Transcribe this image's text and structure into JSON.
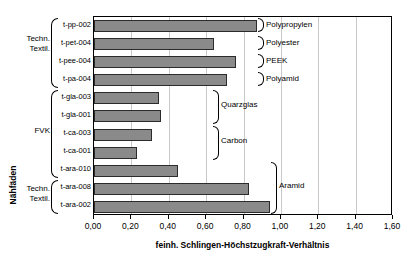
{
  "caption_fragment": "",
  "axes": {
    "y_title": "Nähfäden",
    "x_title": "feinh. Schlingen-Höchstzugkraft-Verhältnis",
    "x_ticks": [
      "0,00",
      "0,20",
      "0,40",
      "0,60",
      "0,80",
      "1,00",
      "1,20",
      "1,40",
      "1,60"
    ]
  },
  "left_groups": [
    {
      "label": "Techn.\nTextil.",
      "line1": "Techn.",
      "line2": "Textil."
    },
    {
      "label": "FVK",
      "line1": "FVK",
      "line2": ""
    },
    {
      "label": "Techn.\nTextil.",
      "line1": "Techn.",
      "line2": "Textil."
    }
  ],
  "left_group_labels": {
    "g0_line1": "Techn.",
    "g0_line2": "Textil.",
    "g1_line1": "FVK",
    "g2_line1": "Techn.",
    "g2_line2": "Textil."
  },
  "materials": [
    {
      "name": "Polypropylen"
    },
    {
      "name": "Polyester"
    },
    {
      "name": "PEEK"
    },
    {
      "name": "Polyamid"
    },
    {
      "name": "Quarzglas"
    },
    {
      "name": "Carbon"
    },
    {
      "name": "Aramid"
    }
  ],
  "material_labels": {
    "m0": "Polypropylen",
    "m1": "Polyester",
    "m2": "PEEK",
    "m3": "Polyamid",
    "m4": "Quarzglas",
    "m5": "Carbon",
    "m6": "Aramid"
  },
  "categories_text": {
    "c0": "t-pp-002",
    "c1": "t-pet-004",
    "c2": "t-pee-004",
    "c3": "t-pa-004",
    "c4": "t-gla-003",
    "c5": "t-gla-001",
    "c6": "t-ca-003",
    "c7": "t-ca-001",
    "c8": "t-ara-010",
    "c9": "t-ara-008",
    "c10": "t-ara-002"
  },
  "colors": {
    "bar_fill": "#8a8a8a",
    "bar_border": "#2b2b2b",
    "grid": "#c9c9c9",
    "frame": "#000000"
  },
  "chart_data": {
    "type": "bar",
    "orientation": "horizontal",
    "title": "",
    "xlabel": "feinh. Schlingen-Höchstzugkraft-Verhältnis",
    "ylabel": "Nähfäden",
    "xlim": [
      0.0,
      1.6
    ],
    "ylim": null,
    "grid": true,
    "grid_axis": "x",
    "legend": "none",
    "x_tick_values": [
      0.0,
      0.2,
      0.4,
      0.6,
      0.8,
      1.0,
      1.2,
      1.4,
      1.6
    ],
    "x_tick_labels": [
      "0,00",
      "0,20",
      "0,40",
      "0,60",
      "0,80",
      "1,00",
      "1,20",
      "1,40",
      "1,60"
    ],
    "categories": [
      "t-pp-002",
      "t-pet-004",
      "t-pee-004",
      "t-pa-004",
      "t-gla-003",
      "t-gla-001",
      "t-ca-003",
      "t-ca-001",
      "t-ara-010",
      "t-ara-008",
      "t-ara-002"
    ],
    "values": [
      0.87,
      0.64,
      0.76,
      0.71,
      0.35,
      0.36,
      0.31,
      0.23,
      0.45,
      0.83,
      0.94
    ],
    "annotations": {
      "left_brackets": [
        {
          "label": "Techn. Textil.",
          "categories": [
            "t-pp-002",
            "t-pet-004",
            "t-pee-004",
            "t-pa-004"
          ]
        },
        {
          "label": "FVK",
          "categories": [
            "t-gla-003",
            "t-gla-001",
            "t-ca-003",
            "t-ca-001",
            "t-ara-010"
          ]
        },
        {
          "label": "Techn. Textil.",
          "categories": [
            "t-ara-008",
            "t-ara-002"
          ]
        }
      ],
      "right_brackets": [
        {
          "label": "Polypropylen",
          "categories": [
            "t-pp-002"
          ]
        },
        {
          "label": "Polyester",
          "categories": [
            "t-pet-004"
          ]
        },
        {
          "label": "PEEK",
          "categories": [
            "t-pee-004"
          ]
        },
        {
          "label": "Polyamid",
          "categories": [
            "t-pa-004"
          ]
        },
        {
          "label": "Quarzglas",
          "categories": [
            "t-gla-003",
            "t-gla-001"
          ]
        },
        {
          "label": "Carbon",
          "categories": [
            "t-ca-003",
            "t-ca-001"
          ]
        },
        {
          "label": "Aramid",
          "categories": [
            "t-ara-010",
            "t-ara-008",
            "t-ara-002"
          ]
        }
      ]
    }
  }
}
